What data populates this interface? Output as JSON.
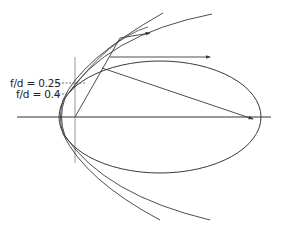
{
  "figure": {
    "labels": [
      {
        "id": "fd-025",
        "text": "f/d = 0.25"
      },
      {
        "id": "fd-04",
        "text": "f/d = 0.4"
      }
    ],
    "colors": {
      "stroke": "#3a3a3a",
      "axis": "#333333",
      "guide": "#8a8a8a",
      "background": "#ffffff"
    },
    "elements": {
      "axis": "horizontal optical axis",
      "focal_line": "vertical reference line",
      "ellipse": "elliptical reflector",
      "parabolas": [
        "parabola f/d = 0.25",
        "parabola f/d = 0.4"
      ],
      "rays": [
        "horizontal reflected ray",
        "ray toward second focus",
        "upper ray",
        "ray from focus"
      ]
    }
  }
}
